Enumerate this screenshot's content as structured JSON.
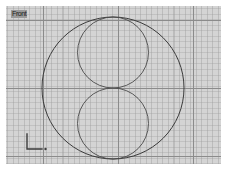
{
  "app": {
    "title": "3D Modeling Viewport",
    "background_color": "#ffffff"
  },
  "viewport": {
    "label": "Front",
    "background_color": "#d4d4d4",
    "grid": {
      "enabled": true,
      "fine_color": "#969696",
      "major_color": "#8b8b8b",
      "fine_spacing_px": 5.55,
      "major_spacing_px": 75,
      "major_vertical_x": [
        37,
        112,
        187
      ],
      "major_horizontal_y": [
        14,
        82,
        150
      ]
    },
    "bounds": {
      "x": 6,
      "y": 6,
      "width": 215,
      "height": 158
    }
  },
  "scene": {
    "stroke_color": "#3b3b3b",
    "shapes": [
      {
        "name": "outer-circle",
        "type": "circle",
        "cx": 107,
        "cy": 82,
        "r": 71,
        "stroke": "#3b3b3b"
      },
      {
        "name": "inner-circle-top",
        "type": "circle",
        "cx": 107,
        "cy": 46.5,
        "r": 35.5,
        "stroke": "#4a4a4a"
      },
      {
        "name": "inner-circle-bottom",
        "type": "circle",
        "cx": 107,
        "cy": 117.5,
        "r": 35.5,
        "stroke": "#4a4a4a"
      }
    ]
  },
  "axis_tripod": {
    "label_x": "",
    "label_y": "",
    "color": "#3d3d3d",
    "origin_dot": true
  }
}
